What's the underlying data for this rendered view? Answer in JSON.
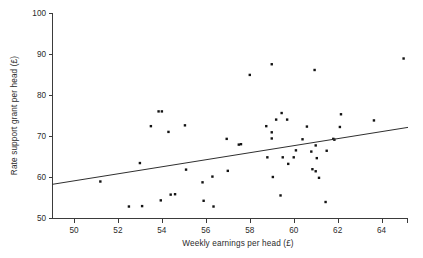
{
  "chart_data": {
    "type": "scatter",
    "title": "",
    "xlabel": "Weekly earnings per head (£)",
    "ylabel": "Rate support grant per head (£)",
    "xlim": [
      49,
      65.2
    ],
    "ylim": [
      50,
      100
    ],
    "xticks": [
      50,
      52,
      54,
      56,
      58,
      60,
      62,
      64
    ],
    "yticks": [
      50,
      60,
      70,
      80,
      90,
      100
    ],
    "xtick_labels": [
      "50",
      "52",
      "54",
      "56",
      "58",
      "60",
      "62",
      "64"
    ],
    "ytick_labels": [
      "50",
      "60",
      "70",
      "80",
      "90",
      "100"
    ],
    "grid": false,
    "legend": "none",
    "marker": "square",
    "marker_color": "#131313",
    "points": [
      {
        "x": 51.2,
        "y": 58.9
      },
      {
        "x": 52.5,
        "y": 52.8
      },
      {
        "x": 53.0,
        "y": 63.4
      },
      {
        "x": 53.1,
        "y": 52.9
      },
      {
        "x": 53.5,
        "y": 72.4
      },
      {
        "x": 53.85,
        "y": 76.0
      },
      {
        "x": 54.0,
        "y": 76.0
      },
      {
        "x": 53.95,
        "y": 54.3
      },
      {
        "x": 54.3,
        "y": 71.0
      },
      {
        "x": 54.4,
        "y": 55.7
      },
      {
        "x": 54.6,
        "y": 55.8
      },
      {
        "x": 55.05,
        "y": 72.6
      },
      {
        "x": 55.1,
        "y": 61.8
      },
      {
        "x": 55.85,
        "y": 58.7
      },
      {
        "x": 55.9,
        "y": 54.2
      },
      {
        "x": 56.3,
        "y": 60.1
      },
      {
        "x": 56.35,
        "y": 52.8
      },
      {
        "x": 56.95,
        "y": 69.3
      },
      {
        "x": 57.0,
        "y": 61.5
      },
      {
        "x": 57.5,
        "y": 67.9
      },
      {
        "x": 57.6,
        "y": 68.0
      },
      {
        "x": 58.0,
        "y": 84.9
      },
      {
        "x": 58.75,
        "y": 72.4
      },
      {
        "x": 58.8,
        "y": 64.8
      },
      {
        "x": 59.0,
        "y": 87.5
      },
      {
        "x": 59.0,
        "y": 70.9
      },
      {
        "x": 59.0,
        "y": 69.4
      },
      {
        "x": 59.05,
        "y": 60.0
      },
      {
        "x": 59.2,
        "y": 74.0
      },
      {
        "x": 59.4,
        "y": 55.5
      },
      {
        "x": 59.45,
        "y": 75.6
      },
      {
        "x": 59.5,
        "y": 64.8
      },
      {
        "x": 59.7,
        "y": 74.0
      },
      {
        "x": 59.75,
        "y": 63.2
      },
      {
        "x": 60.0,
        "y": 64.8
      },
      {
        "x": 60.1,
        "y": 66.5
      },
      {
        "x": 60.4,
        "y": 69.2
      },
      {
        "x": 60.6,
        "y": 72.3
      },
      {
        "x": 60.8,
        "y": 66.2
      },
      {
        "x": 60.95,
        "y": 86.1
      },
      {
        "x": 61.0,
        "y": 67.7
      },
      {
        "x": 61.05,
        "y": 64.6
      },
      {
        "x": 61.0,
        "y": 61.4
      },
      {
        "x": 60.85,
        "y": 61.9
      },
      {
        "x": 61.15,
        "y": 59.8
      },
      {
        "x": 61.45,
        "y": 53.9
      },
      {
        "x": 61.5,
        "y": 66.4
      },
      {
        "x": 61.8,
        "y": 69.3
      },
      {
        "x": 61.85,
        "y": 69.1
      },
      {
        "x": 62.1,
        "y": 72.2
      },
      {
        "x": 62.15,
        "y": 75.3
      },
      {
        "x": 63.65,
        "y": 73.8
      },
      {
        "x": 65.0,
        "y": 88.9
      }
    ],
    "fit_line": {
      "label": "regression line",
      "x1": 49.0,
      "y1": 58.2,
      "x2": 65.2,
      "y2": 72.1
    }
  }
}
